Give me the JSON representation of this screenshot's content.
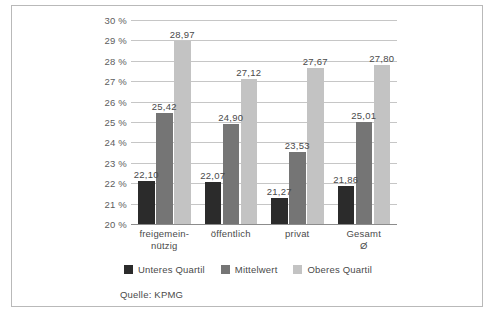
{
  "source_note": "Quelle: KPMG",
  "legend": {
    "position": "bottom-center",
    "items": [
      {
        "label": "Unteres Quartil",
        "color": "#2b2b2b"
      },
      {
        "label": "Mittelwert",
        "color": "#757575"
      },
      {
        "label": "Oberes Quartil",
        "color": "#c3c3c3"
      }
    ]
  },
  "chart_data": {
    "type": "bar",
    "title": "",
    "subtitle": "",
    "xlabel": "",
    "ylabel": "",
    "ylim": [
      20,
      30
    ],
    "ytick_labels": [
      "20 %",
      "21 %",
      "22 %",
      "23 %",
      "24 %",
      "25 %",
      "26 %",
      "27 %",
      "28 %",
      "29 %",
      "30 %"
    ],
    "ytick_values": [
      20,
      21,
      22,
      23,
      24,
      25,
      26,
      27,
      28,
      29,
      30
    ],
    "grid": true,
    "grid_axis": "y",
    "legend_position": "bottom",
    "value_labels": true,
    "decimal_separator": ",",
    "categories": [
      "freigemein-\nnützig",
      "öffentlich",
      "privat",
      "Gesamt Ø"
    ],
    "series": [
      {
        "name": "Unteres Quartil",
        "color": "#2b2b2b",
        "values": [
          22.1,
          22.07,
          21.27,
          21.86
        ],
        "labels": [
          "22,10",
          "22,07",
          "21,27",
          "21,86"
        ]
      },
      {
        "name": "Mittelwert",
        "color": "#757575",
        "values": [
          25.42,
          24.9,
          23.53,
          25.01
        ],
        "labels": [
          "25,42",
          "24,90",
          "23,53",
          "25,01"
        ]
      },
      {
        "name": "Oberes Quartil",
        "color": "#c3c3c3",
        "values": [
          28.97,
          27.12,
          27.67,
          27.8
        ],
        "labels": [
          "28,97",
          "27,12",
          "27,67",
          "27,80"
        ]
      }
    ]
  }
}
